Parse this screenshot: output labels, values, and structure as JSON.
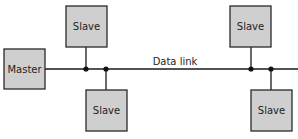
{
  "diagram": {
    "type": "master-slave bus topology",
    "link_label": "Data link",
    "nodes": [
      {
        "id": "master",
        "label": "Master",
        "x": 4,
        "y": 49,
        "w": 41,
        "h": 40
      },
      {
        "id": "slave-top-left",
        "label": "Slave",
        "x": 66,
        "y": 6,
        "w": 41,
        "h": 41
      },
      {
        "id": "slave-bottom-left",
        "label": "Slave",
        "x": 86,
        "y": 90,
        "w": 41,
        "h": 41
      },
      {
        "id": "slave-top-right",
        "label": "Slave",
        "x": 230,
        "y": 6,
        "w": 41,
        "h": 41
      },
      {
        "id": "slave-bottom-right",
        "label": "Slave",
        "x": 251,
        "y": 90,
        "w": 41,
        "h": 41
      }
    ],
    "bus": {
      "y": 69,
      "x_start": 45,
      "x_end": 298
    },
    "junctions": [
      86,
      106,
      251,
      271
    ],
    "colors": {
      "box_fill": "#cfcfcf",
      "stroke": "#1a1a1a",
      "background": "#ffffff"
    }
  }
}
